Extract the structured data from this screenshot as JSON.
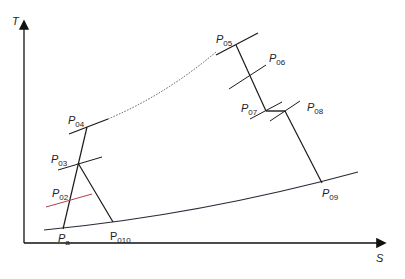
{
  "diagram": {
    "type": "T-s diagram",
    "axes": {
      "y_label": "T",
      "x_label": "S"
    },
    "points": [
      {
        "id": "Pa",
        "main": "P",
        "sub": "a"
      },
      {
        "id": "P02",
        "main": "P",
        "sub": "02"
      },
      {
        "id": "P03",
        "main": "P",
        "sub": "03"
      },
      {
        "id": "P04",
        "main": "P",
        "sub": "04"
      },
      {
        "id": "P05",
        "main": "P",
        "sub": "05"
      },
      {
        "id": "P06",
        "main": "P",
        "sub": "06"
      },
      {
        "id": "P07",
        "main": "P",
        "sub": "07"
      },
      {
        "id": "P08",
        "main": "P",
        "sub": "08"
      },
      {
        "id": "P09",
        "main": "P",
        "sub": "09"
      },
      {
        "id": "P010",
        "main": "P",
        "sub": "010"
      }
    ],
    "colors": {
      "line": "#1a1a1a",
      "isobar_p02": "#b04050",
      "curve": "#2a2a3a"
    }
  }
}
